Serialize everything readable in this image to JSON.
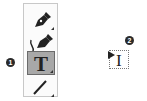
{
  "toolbar": {
    "tools": [
      {
        "name": "pen-tool",
        "icon": "pen-icon",
        "active": false
      },
      {
        "name": "curvature-pen-tool",
        "icon": "curvature-pen-icon",
        "active": false
      },
      {
        "name": "type-tool",
        "icon": "type-t-icon",
        "label": "T",
        "active": true
      },
      {
        "name": "line-tool",
        "icon": "line-icon",
        "active": false
      }
    ]
  },
  "callouts": [
    {
      "number": "1",
      "target": "type-tool"
    },
    {
      "number": "2",
      "target": "type-cursor"
    }
  ],
  "cursor": {
    "icon": "i-beam-cursor-icon",
    "glyph": "I"
  },
  "colors": {
    "active_bg": "#a8a8a8",
    "border": "#c8c8c8",
    "badge": "#2a2a2a"
  }
}
